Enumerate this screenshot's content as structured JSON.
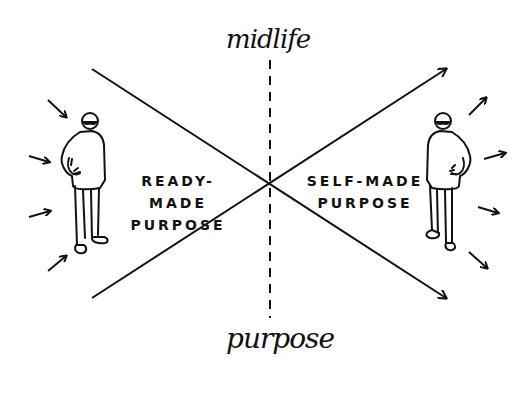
{
  "diagram": {
    "axis_top_label": "midlife",
    "axis_bottom_label": "purpose",
    "left_region": {
      "line1": "READY-MADE",
      "line2": "PURPOSE"
    },
    "right_region": {
      "line1": "SELF-MADE",
      "line2": "PURPOSE"
    },
    "figures": [
      {
        "side": "left",
        "arrows_direction": "inward",
        "arrow_count": 4
      },
      {
        "side": "right",
        "arrows_direction": "outward",
        "arrow_count": 4
      }
    ],
    "stroke_color": "#111111",
    "background_color": "#ffffff"
  }
}
